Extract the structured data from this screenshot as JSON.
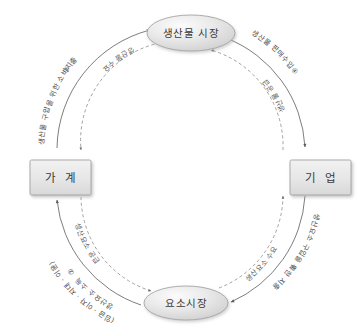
{
  "diagram": {
    "type": "circular-flow",
    "colors": {
      "node_fill": "#e3e3e3",
      "node_stroke": "#9a9a9a",
      "solid_flow": "#6e6e6e",
      "dashed_flow": "#8a8a8a",
      "text": "#3a3a3a",
      "background": "#ffffff"
    }
  },
  "nodes": {
    "product_market": {
      "label": "생산물 시장",
      "shape": "ellipse",
      "position": "top"
    },
    "factor_market": {
      "label": "요소시장",
      "shape": "ellipse",
      "position": "bottom"
    },
    "household": {
      "label": "가 계",
      "shape": "rect",
      "position": "left"
    },
    "firm": {
      "label": "기 업",
      "shape": "rect",
      "position": "right"
    }
  },
  "flows": {
    "outer": {
      "style": "solid",
      "direction": "counterclockwise",
      "description": "화폐 흐름",
      "segments": [
        {
          "id": "1",
          "marker": "①",
          "label": "생산요소 구입을 위한 지출",
          "from": "firm",
          "to": "factor_market",
          "quadrant": "bottom-right"
        },
        {
          "id": "2",
          "marker": "②",
          "label": "생산요소 소득",
          "sublabel": "(임금 · 이자 · 지대 · 이윤)",
          "from": "factor_market",
          "to": "household",
          "quadrant": "bottom-left"
        },
        {
          "id": "3",
          "marker": "③",
          "label": "생산물 구입을 위한 소비지출",
          "from": "household",
          "to": "product_market",
          "quadrant": "top-left"
        },
        {
          "id": "4",
          "marker": "④",
          "label": "생산물 판매수입",
          "from": "product_market",
          "to": "firm",
          "quadrant": "top-right"
        }
      ]
    },
    "inner": {
      "style": "dashed",
      "direction": "clockwise",
      "description": "실물 흐름",
      "segments": [
        {
          "id": "d1",
          "label": "생산물 수요",
          "from": "product_market",
          "to": "household",
          "quadrant": "top-left"
        },
        {
          "id": "d2",
          "label": "생산요소 공급",
          "from": "household",
          "to": "factor_market",
          "quadrant": "bottom-left"
        },
        {
          "id": "d3",
          "label": "생산요소 수요",
          "from": "factor_market",
          "to": "firm",
          "quadrant": "bottom-right"
        },
        {
          "id": "d4",
          "label": "생산물 공급",
          "from": "firm",
          "to": "product_market",
          "quadrant": "top-right"
        }
      ]
    }
  }
}
